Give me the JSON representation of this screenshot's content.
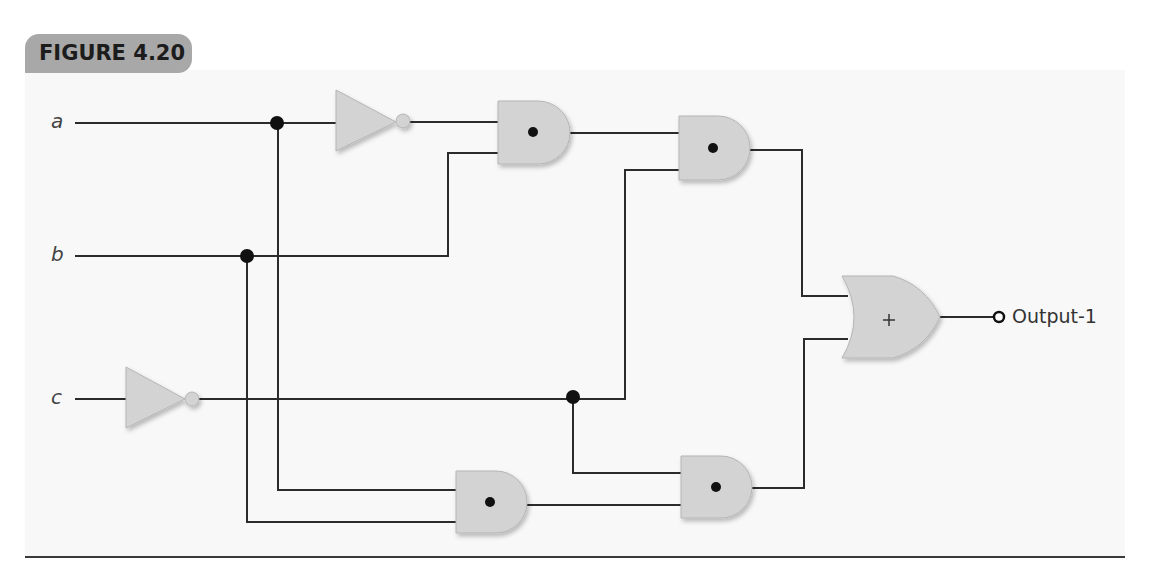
{
  "figure": {
    "label": "FIGURE 4.20",
    "colors": {
      "tab_bg": "#a8a8a8",
      "panel_bg": "#f8f8f8",
      "gate_fill": "#d3d3d3",
      "wire": "#2b2b2b"
    }
  },
  "circuit": {
    "inputs": [
      {
        "name": "a",
        "y": 123
      },
      {
        "name": "b",
        "y": 256
      },
      {
        "name": "c",
        "y": 399
      }
    ],
    "output": {
      "label": "Output-1"
    },
    "gates": [
      {
        "id": "not-a",
        "type": "NOT",
        "input": "a"
      },
      {
        "id": "not-c",
        "type": "NOT",
        "input": "c"
      },
      {
        "id": "and-1",
        "type": "AND",
        "symbol": "•",
        "inputs": [
          "a'",
          "b"
        ]
      },
      {
        "id": "and-2",
        "type": "AND",
        "symbol": "•",
        "inputs": [
          "and-1",
          "c'"
        ]
      },
      {
        "id": "and-3",
        "type": "AND",
        "symbol": "•",
        "inputs": [
          "a",
          "b"
        ]
      },
      {
        "id": "and-4",
        "type": "AND",
        "symbol": "•",
        "inputs": [
          "c'",
          "and-3"
        ]
      },
      {
        "id": "or-1",
        "type": "OR",
        "symbol": "+",
        "inputs": [
          "and-2",
          "and-4"
        ],
        "output": "Output-1"
      }
    ],
    "or_symbol": "+"
  }
}
